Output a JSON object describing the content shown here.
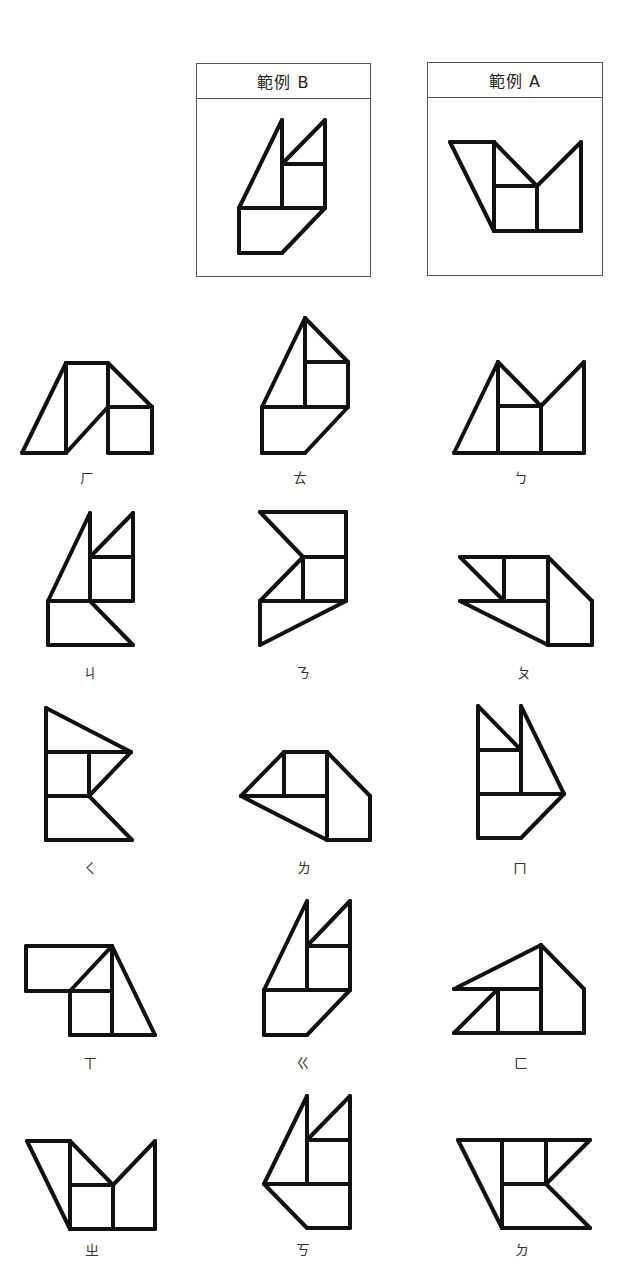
{
  "examples": [
    {
      "id": "B",
      "title": "範例 B",
      "box": {
        "x": 196,
        "y": 63,
        "w": 175,
        "h": 214
      },
      "lines": [
        [
          239,
          208,
          282,
          120
        ],
        [
          282,
          120,
          282,
          208
        ],
        [
          282,
          164,
          325,
          120
        ],
        [
          325,
          120,
          325,
          208
        ],
        [
          282,
          164,
          325,
          164
        ],
        [
          239,
          208,
          325,
          208
        ],
        [
          239,
          208,
          239,
          253
        ],
        [
          239,
          253,
          282,
          253
        ],
        [
          282,
          253,
          325,
          208
        ]
      ]
    },
    {
      "id": "A",
      "title": "範例 A",
      "box": {
        "x": 427,
        "y": 62,
        "w": 176,
        "h": 214
      },
      "lines": [
        [
          450,
          142,
          494,
          142
        ],
        [
          450,
          142,
          494,
          231
        ],
        [
          494,
          142,
          494,
          231
        ],
        [
          494,
          142,
          537,
          186
        ],
        [
          494,
          186,
          537,
          186
        ],
        [
          537,
          186,
          537,
          231
        ],
        [
          537,
          186,
          581,
          142
        ],
        [
          581,
          142,
          581,
          231
        ],
        [
          494,
          231,
          581,
          231
        ]
      ]
    }
  ],
  "figures": [
    {
      "label": "ㄏ",
      "label_pos": {
        "x": 87,
        "y": 470
      },
      "lines": [
        [
          22,
          453,
          66,
          363
        ],
        [
          22,
          453,
          66,
          453
        ],
        [
          66,
          363,
          66,
          453
        ],
        [
          66,
          363,
          108,
          363
        ],
        [
          66,
          453,
          108,
          407
        ],
        [
          108,
          363,
          108,
          453
        ],
        [
          108,
          363,
          152,
          407
        ],
        [
          108,
          407,
          152,
          407
        ],
        [
          152,
          407,
          152,
          453
        ],
        [
          108,
          453,
          152,
          453
        ]
      ]
    },
    {
      "label": "ㄊ",
      "label_pos": {
        "x": 300,
        "y": 470
      },
      "lines": [
        [
          262,
          407,
          305,
          318
        ],
        [
          305,
          318,
          305,
          407
        ],
        [
          305,
          318,
          348,
          362
        ],
        [
          305,
          362,
          348,
          362
        ],
        [
          348,
          362,
          348,
          407
        ],
        [
          262,
          407,
          348,
          407
        ],
        [
          262,
          407,
          262,
          453
        ],
        [
          262,
          453,
          305,
          453
        ],
        [
          305,
          453,
          348,
          407
        ]
      ]
    },
    {
      "label": "ㄅ",
      "label_pos": {
        "x": 521,
        "y": 470
      },
      "lines": [
        [
          454,
          453,
          498,
          362
        ],
        [
          498,
          362,
          498,
          453
        ],
        [
          498,
          362,
          541,
          406
        ],
        [
          498,
          406,
          541,
          406
        ],
        [
          541,
          406,
          541,
          453
        ],
        [
          541,
          406,
          584,
          362
        ],
        [
          584,
          362,
          584,
          453
        ],
        [
          454,
          453,
          584,
          453
        ]
      ]
    },
    {
      "label": "ㄐ",
      "label_pos": {
        "x": 90,
        "y": 665
      },
      "lines": [
        [
          48,
          601,
          90,
          513
        ],
        [
          90,
          513,
          90,
          601
        ],
        [
          90,
          557,
          133,
          513
        ],
        [
          133,
          513,
          133,
          601
        ],
        [
          90,
          557,
          133,
          557
        ],
        [
          48,
          601,
          133,
          601
        ],
        [
          48,
          601,
          48,
          645
        ],
        [
          48,
          645,
          133,
          645
        ],
        [
          90,
          601,
          133,
          645
        ]
      ]
    },
    {
      "label": "ㄋ",
      "label_pos": {
        "x": 303,
        "y": 665
      },
      "lines": [
        [
          260,
          512,
          346,
          512
        ],
        [
          260,
          512,
          303,
          557
        ],
        [
          346,
          512,
          346,
          601
        ],
        [
          303,
          557,
          346,
          557
        ],
        [
          260,
          601,
          303,
          557
        ],
        [
          303,
          557,
          303,
          601
        ],
        [
          260,
          601,
          346,
          601
        ],
        [
          260,
          601,
          260,
          645
        ],
        [
          260,
          645,
          346,
          601
        ]
      ]
    },
    {
      "label": "ㄆ",
      "label_pos": {
        "x": 524,
        "y": 665
      },
      "lines": [
        [
          460,
          557,
          548,
          557
        ],
        [
          460,
          557,
          504,
          601
        ],
        [
          504,
          557,
          504,
          601
        ],
        [
          460,
          601,
          548,
          601
        ],
        [
          460,
          601,
          548,
          645
        ],
        [
          548,
          557,
          548,
          645
        ],
        [
          548,
          557,
          592,
          601
        ],
        [
          592,
          601,
          592,
          645
        ],
        [
          548,
          645,
          592,
          645
        ]
      ]
    },
    {
      "label": "ㄑ",
      "label_pos": {
        "x": 90,
        "y": 860
      },
      "lines": [
        [
          46,
          708,
          46,
          840
        ],
        [
          46,
          708,
          131,
          752
        ],
        [
          46,
          752,
          131,
          752
        ],
        [
          89,
          752,
          89,
          796
        ],
        [
          89,
          796,
          131,
          752
        ],
        [
          46,
          796,
          89,
          796
        ],
        [
          89,
          796,
          132,
          840
        ],
        [
          46,
          840,
          132,
          840
        ]
      ]
    },
    {
      "label": "ㄌ",
      "label_pos": {
        "x": 304,
        "y": 860
      },
      "lines": [
        [
          241,
          796,
          284,
          752
        ],
        [
          284,
          752,
          327,
          752
        ],
        [
          284,
          752,
          284,
          796
        ],
        [
          241,
          796,
          327,
          796
        ],
        [
          241,
          796,
          327,
          840
        ],
        [
          327,
          752,
          327,
          840
        ],
        [
          327,
          752,
          370,
          796
        ],
        [
          370,
          796,
          370,
          840
        ],
        [
          327,
          840,
          370,
          840
        ]
      ]
    },
    {
      "label": "ㄇ",
      "label_pos": {
        "x": 520,
        "y": 860
      },
      "lines": [
        [
          478,
          706,
          478,
          838
        ],
        [
          478,
          706,
          521,
          750
        ],
        [
          478,
          750,
          521,
          750
        ],
        [
          521,
          706,
          521,
          794
        ],
        [
          521,
          706,
          564,
          794
        ],
        [
          478,
          794,
          564,
          794
        ],
        [
          478,
          838,
          521,
          838
        ],
        [
          521,
          838,
          564,
          794
        ]
      ]
    },
    {
      "label": "ㄒ",
      "label_pos": {
        "x": 90,
        "y": 1055
      },
      "lines": [
        [
          26,
          946,
          112,
          946
        ],
        [
          26,
          946,
          26,
          991
        ],
        [
          26,
          991,
          70,
          991
        ],
        [
          70,
          991,
          112,
          946
        ],
        [
          70,
          991,
          70,
          1035
        ],
        [
          70,
          991,
          112,
          991
        ],
        [
          112,
          946,
          112,
          1035
        ],
        [
          112,
          946,
          155,
          1035
        ],
        [
          70,
          1035,
          155,
          1035
        ]
      ]
    },
    {
      "label": "ㄍ",
      "label_pos": {
        "x": 303,
        "y": 1055
      },
      "lines": [
        [
          264,
          990,
          307,
          901
        ],
        [
          307,
          901,
          307,
          990
        ],
        [
          307,
          946,
          350,
          901
        ],
        [
          350,
          901,
          350,
          990
        ],
        [
          307,
          946,
          350,
          946
        ],
        [
          264,
          990,
          350,
          990
        ],
        [
          264,
          990,
          264,
          1035
        ],
        [
          264,
          1035,
          307,
          1035
        ],
        [
          307,
          1035,
          350,
          990
        ]
      ]
    },
    {
      "label": "ㄈ",
      "label_pos": {
        "x": 521,
        "y": 1055
      },
      "lines": [
        [
          454,
          989,
          541,
          945
        ],
        [
          541,
          945,
          541,
          1033
        ],
        [
          541,
          945,
          584,
          989
        ],
        [
          584,
          989,
          584,
          1033
        ],
        [
          454,
          989,
          541,
          989
        ],
        [
          454,
          1033,
          498,
          989
        ],
        [
          498,
          989,
          498,
          1033
        ],
        [
          454,
          1033,
          584,
          1033
        ]
      ]
    },
    {
      "label": "ㄓ",
      "label_pos": {
        "x": 92,
        "y": 1242
      },
      "lines": [
        [
          27,
          1141,
          70,
          1141
        ],
        [
          27,
          1141,
          70,
          1229
        ],
        [
          70,
          1141,
          70,
          1229
        ],
        [
          70,
          1141,
          113,
          1185
        ],
        [
          70,
          1185,
          113,
          1185
        ],
        [
          113,
          1185,
          113,
          1229
        ],
        [
          113,
          1185,
          155,
          1141
        ],
        [
          155,
          1141,
          155,
          1229
        ],
        [
          70,
          1229,
          155,
          1229
        ]
      ]
    },
    {
      "label": "ㄎ",
      "label_pos": {
        "x": 303,
        "y": 1242
      },
      "lines": [
        [
          264,
          1184,
          307,
          1096
        ],
        [
          307,
          1096,
          307,
          1184
        ],
        [
          307,
          1140,
          350,
          1096
        ],
        [
          350,
          1096,
          350,
          1228
        ],
        [
          307,
          1140,
          350,
          1140
        ],
        [
          264,
          1184,
          350,
          1184
        ],
        [
          264,
          1184,
          307,
          1228
        ],
        [
          307,
          1228,
          350,
          1228
        ]
      ]
    },
    {
      "label": "ㄉ",
      "label_pos": {
        "x": 522,
        "y": 1242
      },
      "lines": [
        [
          458,
          1140,
          590,
          1140
        ],
        [
          458,
          1140,
          502,
          1228
        ],
        [
          502,
          1140,
          502,
          1228
        ],
        [
          546,
          1140,
          546,
          1184
        ],
        [
          502,
          1184,
          546,
          1184
        ],
        [
          546,
          1184,
          590,
          1140
        ],
        [
          546,
          1184,
          590,
          1228
        ],
        [
          502,
          1228,
          590,
          1228
        ]
      ]
    }
  ],
  "style": {
    "stroke": "#111111",
    "stroke_width": 4,
    "box_border": "#555555"
  }
}
